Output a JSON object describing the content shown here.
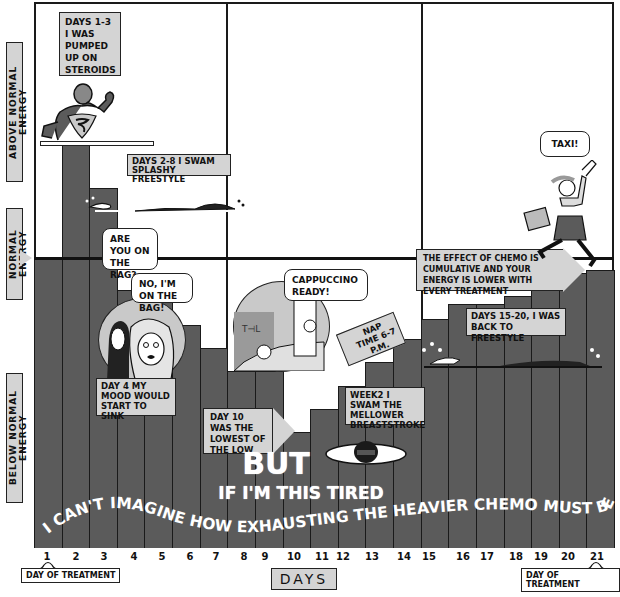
{
  "chart_data": {
    "type": "bar",
    "title": "",
    "xlabel": "DAYS",
    "ylabel": "Energy level",
    "y_bands": [
      "BELOW NORMAL ENERGY",
      "NORMAL ENERGY",
      "ABOVE NORMAL ENERGY"
    ],
    "categories": [
      "1",
      "2",
      "3",
      "4",
      "5",
      "6",
      "7",
      "8",
      "9",
      "10",
      "11",
      "12",
      "13",
      "14",
      "15",
      "16",
      "17",
      "18",
      "19",
      "20",
      "21"
    ],
    "values": [
      100,
      139,
      124,
      89,
      86,
      77,
      69,
      61,
      61,
      40,
      48,
      56,
      64,
      72,
      79,
      84,
      84,
      87,
      92,
      95,
      96
    ],
    "value_note": "Relative energy, 100 = normal energy line",
    "ylim": [
      0,
      190
    ],
    "grid": false,
    "legend": null,
    "annotations": [
      {
        "day_range": "1-3",
        "text": "DAYS 1-3 I WAS PUMPED UP ON STEROIDS"
      },
      {
        "day_range": "2-8",
        "text": "DAYS 2-8 I SWAM SPLASHY FREESTYLE"
      },
      {
        "day": 4,
        "text": "DAY 4 MY MOOD WOULD START TO SINK"
      },
      {
        "day": 10,
        "text": "DAY 10 WAS THE LOWEST OF THE LOW"
      },
      {
        "day_range": "11-14",
        "text": "WEEK 2 I SWAM THE MELLOWER BREASTSTROKE"
      },
      {
        "day_range": "15-20",
        "text": "DAYS 15-20, I WAS BACK TO FREESTYLE"
      },
      {
        "text": "THE EFFECT OF CHEMO IS CUMULATIVE AND YOUR ENERGY IS LOWER WITH EVERY TREATMENT"
      },
      {
        "day": 1,
        "text": "DAY OF TREATMENT"
      },
      {
        "day": 21,
        "text": "DAY OF TREATMENT"
      }
    ]
  },
  "yaxis": {
    "above": "ABOVE NORMAL ENERGY",
    "normal": "NORMAL ENERGY",
    "below": "BELOW NORMAL ENERGY"
  },
  "xaxis": {
    "label": "DAYS",
    "ticks": [
      "1",
      "2",
      "3",
      "4",
      "5",
      "6",
      "7",
      "8",
      "9",
      "10",
      "11",
      "12",
      "13",
      "14",
      "15",
      "16",
      "17",
      "18",
      "19",
      "20",
      "21"
    ],
    "treatment_start": "DAY OF TREATMENT",
    "treatment_end": "DAY OF TREATMENT"
  },
  "captions": {
    "steroids": "DAYS 1-3 I WAS PUMPED UP ON STEROIDS",
    "splashy": "DAYS 2-8 I SWAM SPLASHY FREESTYLE",
    "mood": "DAY 4 MY MOOD WOULD START TO SINK",
    "lowest": "DAY 10 WAS THE LOWEST OF THE LOW",
    "breaststroke": "WEEK2 I SWAM THE MELLOWER BREASTSTROKE",
    "freestyle": "DAYS 15-20, I WAS BACK TO FREESTYLE",
    "cumulative": "THE EFFECT OF CHEMO IS CUMULATIVE AND YOUR ENERGY IS LOWER WITH EVERY TREATMENT",
    "nap": "NAP TIME 6-7 P.M."
  },
  "bubbles": {
    "rag": "ARE YOU ON THE RAG?",
    "bag": "NO, I'M ON THE BAG!",
    "cappuccino": "CAPPUCCINO READY!",
    "taxi": "TAXI!",
    "sign": "TFL"
  },
  "punchline": {
    "line1": "BUT",
    "line2": "IF I'M THIS TIRED",
    "line3": "I CAN'T IMAGINE HOW EXHAUSTING THE HEAVIER CHEMO MUST BE."
  },
  "colors": {
    "bar": "#5b5b5b",
    "label_bg": "#d4d4d4",
    "line": "#1a1a1a"
  }
}
